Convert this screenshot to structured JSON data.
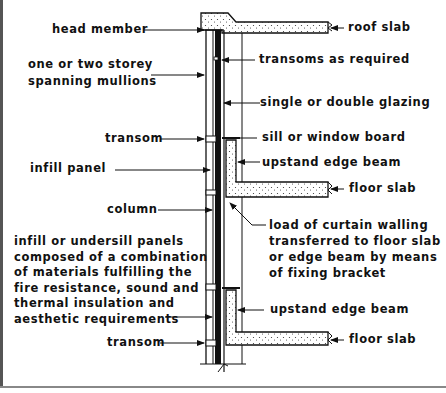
{
  "diagram": {
    "colors": {
      "ink": "#111111",
      "background": "#ffffff",
      "hatch": "#f2f2f2"
    },
    "labels_left": {
      "head_member": "head member",
      "mullions": "one or two storey\nspanning mullions",
      "transom_upper": "transom",
      "infill_panel": "infill panel",
      "column": "column",
      "infill_description": "infill or undersill panels\ncomposed of a combination\nof materials fulfilling the\nfire resistance, sound and\nthermal insulation and\naesthetic requirements",
      "transom_lower": "transom"
    },
    "labels_right": {
      "roof_slab": "roof slab",
      "transoms_as_required": "transoms as required",
      "glazing": "single or double glazing",
      "sill": "sill or window board",
      "upstand_upper": "upstand edge beam",
      "floor_slab_upper": "floor slab",
      "load_description": "load of curtain walling\ntransferred to floor slab\nor edge beam by means\nof fixing bracket",
      "upstand_lower": "upstand edge beam",
      "floor_slab_lower": "floor slab"
    }
  }
}
